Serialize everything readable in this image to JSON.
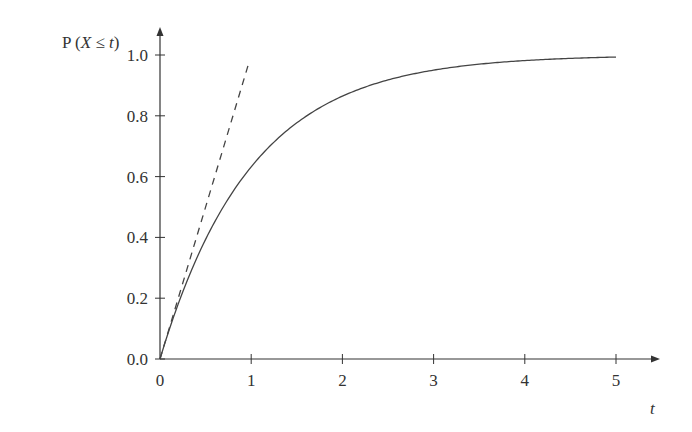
{
  "chart_data": {
    "type": "line",
    "title": "",
    "ylabel": "P (X ≤ t)",
    "xlabel": "t",
    "xlim": [
      0,
      5.5
    ],
    "ylim": [
      0,
      1.1
    ],
    "x_ticks": [
      "0",
      "1",
      "2",
      "3",
      "4",
      "5"
    ],
    "y_ticks": [
      "0.0",
      "0.2",
      "0.4",
      "0.6",
      "0.8",
      "1.0"
    ],
    "grid": false,
    "legend": null,
    "series": [
      {
        "name": "CDF 1 - e^(-t)",
        "style": "solid",
        "x": [
          0,
          0.25,
          0.5,
          0.75,
          1,
          1.5,
          2,
          2.5,
          3,
          3.5,
          4,
          4.5,
          5
        ],
        "values": [
          0,
          0.221,
          0.393,
          0.528,
          0.632,
          0.777,
          0.865,
          0.918,
          0.95,
          0.97,
          0.982,
          0.989,
          0.993
        ]
      },
      {
        "name": "tangent at origin (y = t)",
        "style": "dashed",
        "x": [
          0,
          0.98
        ],
        "values": [
          0,
          0.98
        ]
      }
    ]
  },
  "labels": {
    "y_axis_prefix": "P (",
    "y_axis_var": "X",
    "y_axis_rel": " ≤ ",
    "y_axis_t": "t",
    "y_axis_suffix": ")",
    "x_axis": "t"
  }
}
